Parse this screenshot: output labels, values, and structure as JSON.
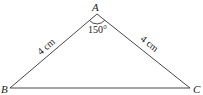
{
  "diagram": {
    "type": "triangle",
    "vertices": [
      {
        "label": "A",
        "x": 97,
        "y": 14
      },
      {
        "label": "B",
        "x": 10,
        "y": 88
      },
      {
        "label": "C",
        "x": 190,
        "y": 88
      }
    ],
    "sides": [
      {
        "from": "A",
        "to": "B",
        "label": "4 cm"
      },
      {
        "from": "A",
        "to": "C",
        "label": "4 cm"
      },
      {
        "from": "B",
        "to": "C",
        "label": ""
      }
    ],
    "angles": [
      {
        "vertex": "A",
        "label": "150°"
      }
    ]
  }
}
